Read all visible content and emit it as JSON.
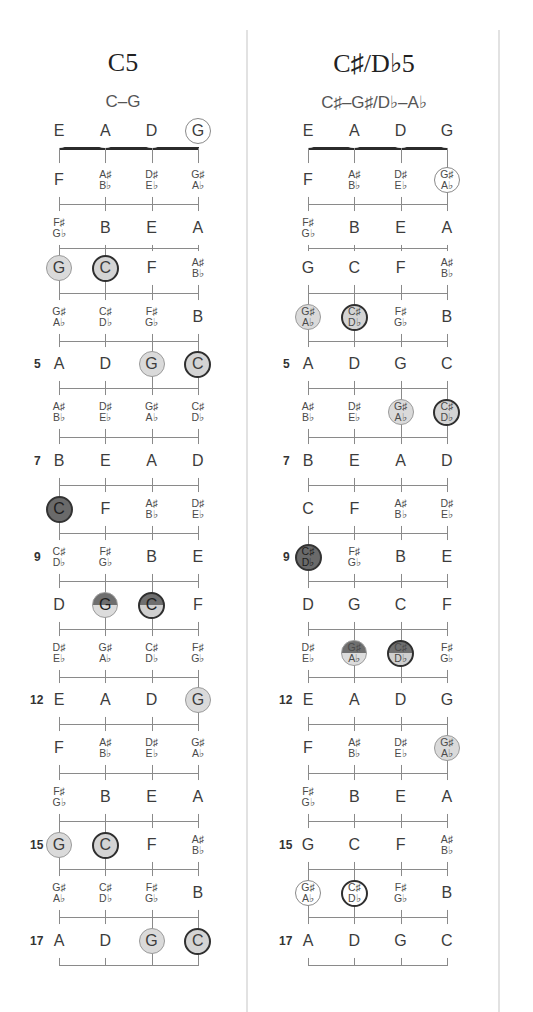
{
  "diagrams": [
    {
      "title": "C5",
      "subtitle": "C–G",
      "strings": [
        "E",
        "A",
        "D",
        "G"
      ],
      "fret_numbers": {
        "5": "5",
        "7": "7",
        "9": "9",
        "12": "12",
        "15": "15",
        "17": "17"
      },
      "rows": [
        [
          [
            "E"
          ],
          [
            "A"
          ],
          [
            "D"
          ],
          [
            "G"
          ]
        ],
        [
          [
            "F"
          ],
          [
            "A♯",
            "B♭"
          ],
          [
            "D♯",
            "E♭"
          ],
          [
            "G♯",
            "A♭"
          ]
        ],
        [
          [
            "F♯",
            "G♭"
          ],
          [
            "B"
          ],
          [
            "E"
          ],
          [
            "A"
          ]
        ],
        [
          [
            "G"
          ],
          [
            "C"
          ],
          [
            "F"
          ],
          [
            "A♯",
            "B♭"
          ]
        ],
        [
          [
            "G♯",
            "A♭"
          ],
          [
            "C♯",
            "D♭"
          ],
          [
            "F♯",
            "G♭"
          ],
          [
            "B"
          ]
        ],
        [
          [
            "A"
          ],
          [
            "D"
          ],
          [
            "G"
          ],
          [
            "C"
          ]
        ],
        [
          [
            "A♯",
            "B♭"
          ],
          [
            "D♯",
            "E♭"
          ],
          [
            "G♯",
            "A♭"
          ],
          [
            "C♯",
            "D♭"
          ]
        ],
        [
          [
            "B"
          ],
          [
            "E"
          ],
          [
            "A"
          ],
          [
            "D"
          ]
        ],
        [
          [
            "C"
          ],
          [
            "F"
          ],
          [
            "A♯",
            "B♭"
          ],
          [
            "D♯",
            "E♭"
          ]
        ],
        [
          [
            "C♯",
            "D♭"
          ],
          [
            "F♯",
            "G♭"
          ],
          [
            "B"
          ],
          [
            "E"
          ]
        ],
        [
          [
            "D"
          ],
          [
            "G"
          ],
          [
            "C"
          ],
          [
            "F"
          ]
        ],
        [
          [
            "D♯",
            "E♭"
          ],
          [
            "G♯",
            "A♭"
          ],
          [
            "C♯",
            "D♭"
          ],
          [
            "F♯",
            "G♭"
          ]
        ],
        [
          [
            "E"
          ],
          [
            "A"
          ],
          [
            "D"
          ],
          [
            "G"
          ]
        ],
        [
          [
            "F"
          ],
          [
            "A♯",
            "B♭"
          ],
          [
            "D♯",
            "E♭"
          ],
          [
            "G♯",
            "A♭"
          ]
        ],
        [
          [
            "F♯",
            "G♭"
          ],
          [
            "B"
          ],
          [
            "E"
          ],
          [
            "A"
          ]
        ],
        [
          [
            "G"
          ],
          [
            "C"
          ],
          [
            "F"
          ],
          [
            "A♯",
            "B♭"
          ]
        ],
        [
          [
            "G♯",
            "A♭"
          ],
          [
            "C♯",
            "D♭"
          ],
          [
            "F♯",
            "G♭"
          ],
          [
            "B"
          ]
        ],
        [
          [
            "A"
          ],
          [
            "D"
          ],
          [
            "G"
          ],
          [
            "C"
          ]
        ]
      ],
      "markers": {
        "0-3": "open",
        "3-0": "fifth",
        "3-1": "root",
        "5-2": "fifth",
        "5-3": "root",
        "8-0": "dark",
        "10-1": "split-fifth",
        "10-2": "split-root",
        "12-3": "fifth",
        "15-0": "fifth",
        "15-1": "root",
        "17-2": "fifth",
        "17-3": "root"
      }
    },
    {
      "title": "C♯/D♭5",
      "subtitle": "C♯–G♯/D♭–A♭",
      "strings": [
        "E",
        "A",
        "D",
        "G"
      ],
      "fret_numbers": {
        "5": "5",
        "7": "7",
        "9": "9",
        "12": "12",
        "15": "15",
        "17": "17"
      },
      "rows": [
        [
          [
            "E"
          ],
          [
            "A"
          ],
          [
            "D"
          ],
          [
            "G"
          ]
        ],
        [
          [
            "F"
          ],
          [
            "A♯",
            "B♭"
          ],
          [
            "D♯",
            "E♭"
          ],
          [
            "G♯",
            "A♭"
          ]
        ],
        [
          [
            "F♯",
            "G♭"
          ],
          [
            "B"
          ],
          [
            "E"
          ],
          [
            "A"
          ]
        ],
        [
          [
            "G"
          ],
          [
            "C"
          ],
          [
            "F"
          ],
          [
            "A♯",
            "B♭"
          ]
        ],
        [
          [
            "G♯",
            "A♭"
          ],
          [
            "C♯",
            "D♭"
          ],
          [
            "F♯",
            "G♭"
          ],
          [
            "B"
          ]
        ],
        [
          [
            "A"
          ],
          [
            "D"
          ],
          [
            "G"
          ],
          [
            "C"
          ]
        ],
        [
          [
            "A♯",
            "B♭"
          ],
          [
            "D♯",
            "E♭"
          ],
          [
            "G♯",
            "A♭"
          ],
          [
            "C♯",
            "D♭"
          ]
        ],
        [
          [
            "B"
          ],
          [
            "E"
          ],
          [
            "A"
          ],
          [
            "D"
          ]
        ],
        [
          [
            "C"
          ],
          [
            "F"
          ],
          [
            "A♯",
            "B♭"
          ],
          [
            "D♯",
            "E♭"
          ]
        ],
        [
          [
            "C♯",
            "D♭"
          ],
          [
            "F♯",
            "G♭"
          ],
          [
            "B"
          ],
          [
            "E"
          ]
        ],
        [
          [
            "D"
          ],
          [
            "G"
          ],
          [
            "C"
          ],
          [
            "F"
          ]
        ],
        [
          [
            "D♯",
            "E♭"
          ],
          [
            "G♯",
            "A♭"
          ],
          [
            "C♯",
            "D♭"
          ],
          [
            "F♯",
            "G♭"
          ]
        ],
        [
          [
            "E"
          ],
          [
            "A"
          ],
          [
            "D"
          ],
          [
            "G"
          ]
        ],
        [
          [
            "F"
          ],
          [
            "A♯",
            "B♭"
          ],
          [
            "D♯",
            "E♭"
          ],
          [
            "G♯",
            "A♭"
          ]
        ],
        [
          [
            "F♯",
            "G♭"
          ],
          [
            "B"
          ],
          [
            "E"
          ],
          [
            "A"
          ]
        ],
        [
          [
            "G"
          ],
          [
            "C"
          ],
          [
            "F"
          ],
          [
            "A♯",
            "B♭"
          ]
        ],
        [
          [
            "G♯",
            "A♭"
          ],
          [
            "C♯",
            "D♭"
          ],
          [
            "F♯",
            "G♭"
          ],
          [
            "B"
          ]
        ],
        [
          [
            "A"
          ],
          [
            "D"
          ],
          [
            "G"
          ],
          [
            "C"
          ]
        ]
      ],
      "markers": {
        "1-3": "open",
        "4-0": "fifth",
        "4-1": "root",
        "6-2": "fifth",
        "6-3": "root",
        "9-0": "dark",
        "11-1": "split-fifth",
        "11-2": "split-root",
        "13-3": "fifth",
        "16-0": "open",
        "16-1": "open-root"
      }
    }
  ],
  "legend_colors": {
    "root_border": "#2f2f2f",
    "fifth_fill": "#dadada",
    "dark_fill": "#6a6a6a"
  }
}
